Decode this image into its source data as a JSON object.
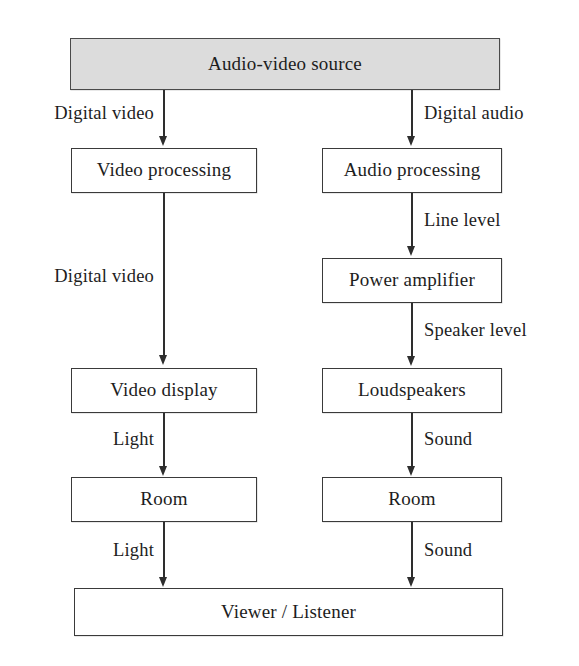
{
  "diagram": {
    "colors": {
      "source_fill": "#dcdcdc",
      "node_fill": "#ffffff",
      "stroke": "#2e2e2e",
      "background": "#ffffff"
    },
    "nodes": {
      "source": "Audio-video source",
      "video_processing": "Video processing",
      "audio_processing": "Audio processing",
      "power_amplifier": "Power amplifier",
      "video_display": "Video display",
      "loudspeakers": "Loudspeakers",
      "video_room": "Room",
      "audio_room": "Room",
      "viewer_listener": "Viewer / Listener"
    },
    "edge_labels": {
      "source_to_video": "Digital video",
      "source_to_audio": "Digital audio",
      "video_proc_to_display": "Digital video",
      "audio_proc_to_amp": "Line level",
      "amp_to_loudspeakers": "Speaker level",
      "display_to_room": "Light",
      "loudspeakers_to_room": "Sound",
      "video_room_to_viewer": "Light",
      "audio_room_to_viewer": "Sound"
    }
  }
}
